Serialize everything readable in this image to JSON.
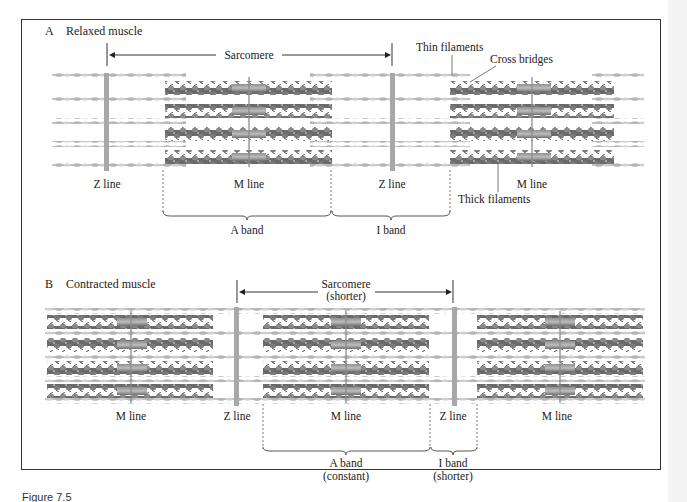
{
  "figure": {
    "caption": "Figure 7.5"
  },
  "panel_a": {
    "letter": "A",
    "title": "Relaxed muscle",
    "sarcomere_label": "Sarcomere",
    "labels": {
      "thin_filaments": "Thin filaments",
      "cross_bridges": "Cross bridges",
      "thick_filaments": "Thick filaments",
      "z_line_1": "Z line",
      "m_line_1": "M line",
      "z_line_2": "Z line",
      "m_line_2": "M line",
      "a_band": "A band",
      "i_band": "I band"
    }
  },
  "panel_b": {
    "letter": "B",
    "title": "Contracted muscle",
    "sarcomere_label": "Sarcomere",
    "sarcomere_sub": "(shorter)",
    "labels": {
      "m_line_1": "M line",
      "z_line_1": "Z line",
      "m_line_2": "M line",
      "z_line_2": "Z line",
      "m_line_3": "M line",
      "a_band": "A band",
      "a_band_sub": "(constant)",
      "i_band": "I band",
      "i_band_sub": "(shorter)"
    }
  },
  "colors": {
    "thin_filament": "#b9b9b9",
    "thick_filament": "#6e6e6e",
    "thick_core": "#9a9a9a",
    "z_line": "#a8a8a8",
    "m_line": "#8c8c8c",
    "border": "#333333"
  }
}
